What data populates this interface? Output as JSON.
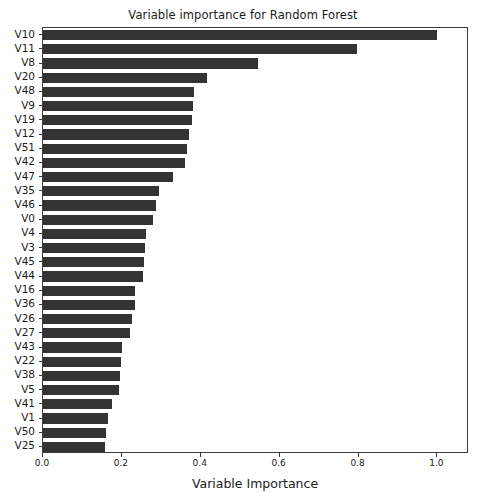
{
  "chart_data": {
    "type": "bar",
    "orientation": "horizontal",
    "title": "Variable importance for Random Forest",
    "xlabel": "Variable Importance",
    "ylabel": "",
    "xlim": [
      0.0,
      1.08
    ],
    "ylim": [
      0,
      30
    ],
    "grid": false,
    "legend": null,
    "bar_color": "#333333",
    "xticks": [
      0.0,
      0.2,
      0.4,
      0.6,
      0.8,
      1.0
    ],
    "xtick_labels": [
      "0.0",
      "0.2",
      "0.4",
      "0.6",
      "0.8",
      "1.0"
    ],
    "categories": [
      "V10",
      "V11",
      "V8",
      "V20",
      "V48",
      "V9",
      "V19",
      "V12",
      "V51",
      "V42",
      "V47",
      "V35",
      "V46",
      "V0",
      "V4",
      "V3",
      "V45",
      "V44",
      "V16",
      "V36",
      "V26",
      "V27",
      "V43",
      "V22",
      "V38",
      "V5",
      "V41",
      "V1",
      "V50",
      "V25"
    ],
    "values": [
      1.0,
      0.797,
      0.545,
      0.415,
      0.382,
      0.381,
      0.379,
      0.371,
      0.366,
      0.361,
      0.329,
      0.294,
      0.287,
      0.28,
      0.262,
      0.258,
      0.255,
      0.254,
      0.233,
      0.232,
      0.225,
      0.22,
      0.2,
      0.198,
      0.195,
      0.193,
      0.175,
      0.165,
      0.16,
      0.158
    ]
  },
  "figure": {
    "title": "Variable importance for Random Forest",
    "xaxis_title": "Variable Importance"
  }
}
